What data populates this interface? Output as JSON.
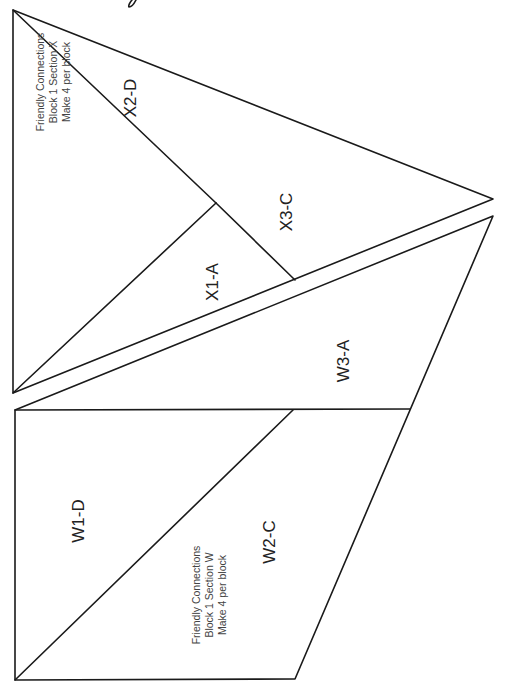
{
  "diagram": {
    "type": "foundation paper piecing pattern",
    "line_color": "#1a1a1a",
    "background": "#ffffff",
    "sections": [
      {
        "id": "X",
        "note_lines": [
          "Friendly Connections",
          "Block 1 Section X",
          "Make 4 per block"
        ],
        "pieces": [
          {
            "label": "X1-A"
          },
          {
            "label": "X2-D"
          },
          {
            "label": "X3-C"
          }
        ]
      },
      {
        "id": "W",
        "note_lines": [
          "Friendly Connections",
          "Block 1 Section W",
          "Make 4 per block"
        ],
        "pieces": [
          {
            "label": "W1-D"
          },
          {
            "label": "W2-C"
          },
          {
            "label": "W3-A"
          }
        ]
      }
    ]
  }
}
